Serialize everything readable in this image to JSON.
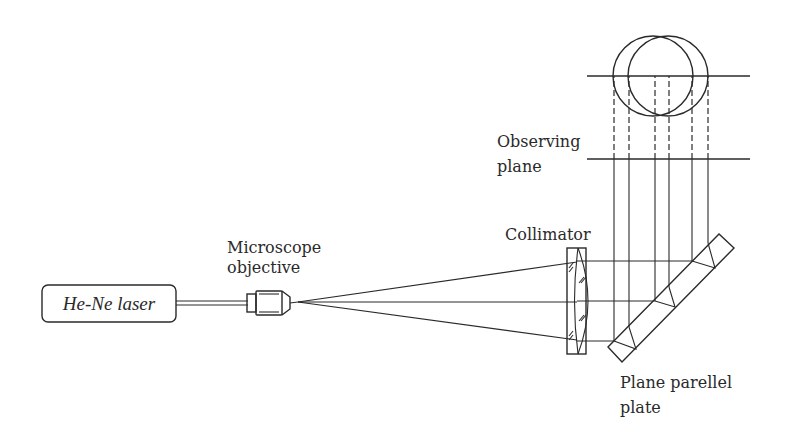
{
  "figure": {
    "labels": {
      "laser": "He-Ne laser",
      "objective_line1": "Microscope",
      "objective_line2": "objective",
      "collimator": "Collimator",
      "observing_line1": "Observing",
      "observing_line2": "plane",
      "plate_line1": "Plane parellel",
      "plate_line2": "plate"
    },
    "components": [
      {
        "id": "laser",
        "name": "He-Ne laser"
      },
      {
        "id": "objective",
        "name": "Microscope objective"
      },
      {
        "id": "collimator",
        "name": "Collimator"
      },
      {
        "id": "plate",
        "name": "Plane parellel plate"
      },
      {
        "id": "observing_plane",
        "name": "Observing plane"
      }
    ],
    "colors": {
      "stroke": "#2a2a2a",
      "background": "#ffffff"
    }
  }
}
